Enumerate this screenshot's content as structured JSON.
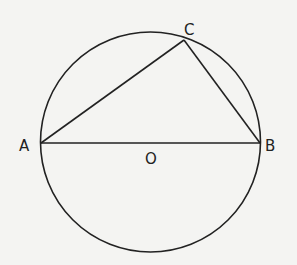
{
  "diagram": {
    "labels": {
      "A": "A",
      "B": "B",
      "C": "C",
      "O": "O"
    },
    "colors": {
      "background": "#f4f4f2",
      "stroke": "#222222"
    }
  }
}
